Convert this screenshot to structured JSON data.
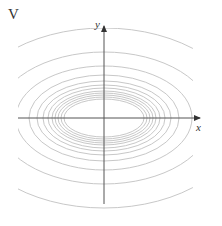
{
  "figure": {
    "panel_label": "V",
    "x_axis_label": "x",
    "y_axis_label": "y"
  },
  "colors": {
    "axis": "#555555",
    "contour": "#c8c8c8",
    "background": "#ffffff"
  },
  "contours": {
    "center": [
      104,
      118
    ],
    "ellipses": [
      {
        "rx": 40,
        "ry": 19
      },
      {
        "rx": 43,
        "ry": 21
      },
      {
        "rx": 46,
        "ry": 23
      },
      {
        "rx": 49,
        "ry": 25
      },
      {
        "rx": 52,
        "ry": 27
      },
      {
        "rx": 56,
        "ry": 30
      },
      {
        "rx": 61,
        "ry": 33
      },
      {
        "rx": 67,
        "ry": 37
      },
      {
        "rx": 75,
        "ry": 43
      },
      {
        "rx": 88,
        "ry": 52
      },
      {
        "rx": 108,
        "ry": 66
      },
      {
        "rx": 140,
        "ry": 90
      },
      {
        "rx": 190,
        "ry": 126
      }
    ]
  }
}
